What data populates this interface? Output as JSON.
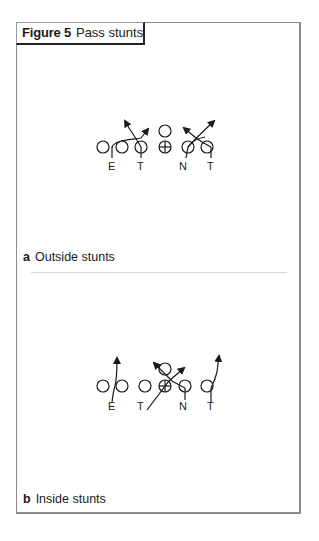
{
  "figure": {
    "number": "Figure 5",
    "title": "Pass stunts"
  },
  "panels": [
    {
      "letter": "a",
      "caption": "Outside stunts",
      "labels": [
        "E",
        "T",
        "N",
        "T"
      ]
    },
    {
      "letter": "b",
      "caption": "Inside stunts",
      "labels": [
        "E",
        "T",
        "N",
        "T"
      ]
    }
  ],
  "colors": {
    "line": "#1a1a1a",
    "frame": "#8a8a8a",
    "separator": "#d6d6d6"
  }
}
